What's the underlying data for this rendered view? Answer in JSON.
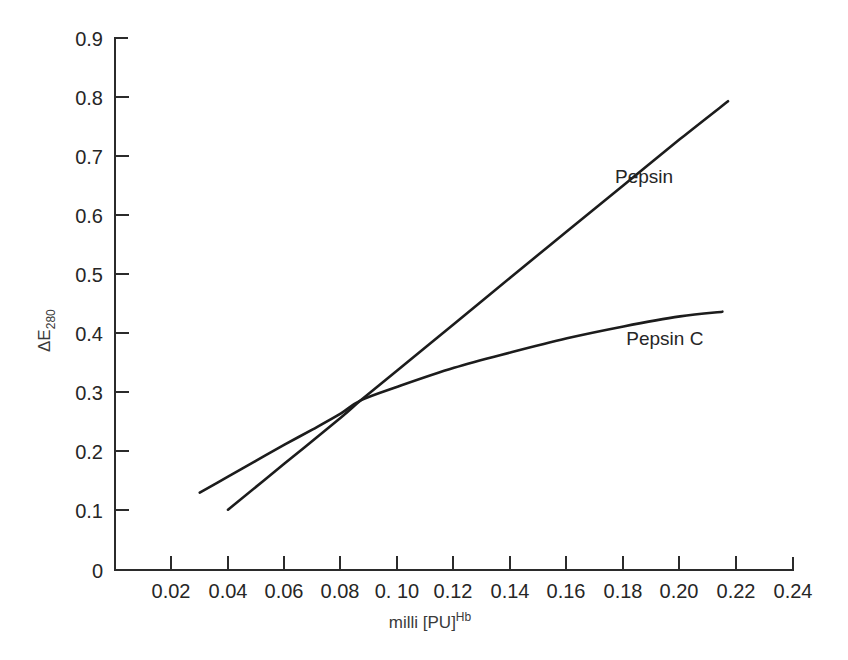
{
  "chart_data": {
    "type": "line",
    "title": "",
    "subtitle": "",
    "xlabel": "milli [PU]Hb",
    "xlabel_parts": {
      "base": "milli [PU]",
      "superscript": "Hb"
    },
    "ylabel": "ΔE280",
    "ylabel_parts": {
      "symbol": "ΔE",
      "subscript": "280"
    },
    "xlim": [
      0,
      0.24
    ],
    "ylim": [
      0,
      0.9
    ],
    "grid": false,
    "legend_position": "inline-annotation",
    "xticks": [
      0,
      0.02,
      0.04,
      0.06,
      0.08,
      0.1,
      0.12,
      0.14,
      0.16,
      0.18,
      0.2,
      0.22,
      0.24
    ],
    "xtick_labels": [
      "0",
      "0.02",
      "0.04",
      "0.06",
      "0.08",
      "0. 10",
      "0.12",
      "0.14",
      "0.16",
      "0.18",
      "0.20",
      "0.22",
      "0.24"
    ],
    "yticks": [
      0,
      0.1,
      0.2,
      0.3,
      0.4,
      0.5,
      0.6,
      0.7,
      0.8,
      0.9
    ],
    "ytick_labels": [
      "0",
      "0.1",
      "0.2",
      "0.3",
      "0.4",
      "0.5",
      "0.6",
      "0.7",
      "0.8",
      "0.9"
    ],
    "series": [
      {
        "name": "Pepsin",
        "label": "Pepsin",
        "color": "#1c1c1c",
        "shape": "straight",
        "x": [
          0.04,
          0.06,
          0.08,
          0.087,
          0.1,
          0.12,
          0.14,
          0.16,
          0.18,
          0.2,
          0.217
        ],
        "y": [
          0.102,
          0.18,
          0.258,
          0.287,
          0.338,
          0.416,
          0.495,
          0.573,
          0.651,
          0.729,
          0.793
        ]
      },
      {
        "name": "Pepsin C",
        "label": "Pepsin C",
        "color": "#1c1c1c",
        "shape": "concave",
        "x": [
          0.03,
          0.04,
          0.05,
          0.06,
          0.07,
          0.08,
          0.087,
          0.1,
          0.12,
          0.14,
          0.16,
          0.18,
          0.2,
          0.215
        ],
        "y": [
          0.131,
          0.158,
          0.185,
          0.212,
          0.238,
          0.265,
          0.287,
          0.31,
          0.342,
          0.368,
          0.392,
          0.412,
          0.429,
          0.437
        ]
      }
    ],
    "annotations": [
      {
        "text": "Pepsin",
        "x": 0.177,
        "y": 0.655
      },
      {
        "text": "Pepsin C",
        "x": 0.181,
        "y": 0.381
      }
    ]
  }
}
